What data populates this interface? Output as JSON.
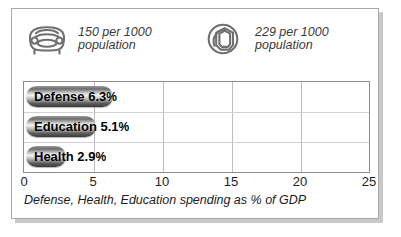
{
  "stats": [
    {
      "icon": "car-icon",
      "icon_label": "car",
      "value_text": "150 per 1000\npopulation"
    },
    {
      "icon": "telephone-icon",
      "icon_label": "telephone",
      "value_text": "229 per 1000\npopulation"
    }
  ],
  "chart_data": {
    "type": "bar",
    "orientation": "horizontal",
    "title": "",
    "caption": "Defense, Health, Education spending as % of GDP",
    "categories": [
      "Defense",
      "Education",
      "Health"
    ],
    "values": [
      6.3,
      5.1,
      2.9
    ],
    "value_labels": [
      "6.3%",
      "5.1%",
      "2.9%"
    ],
    "bar_labels": [
      "Defense 6.3%",
      "Education 5.1%",
      "Health 2.9%"
    ],
    "xlabel": "",
    "ylabel": "",
    "xlim": [
      0,
      25
    ],
    "xticks": [
      0,
      5,
      10,
      15,
      20,
      25
    ],
    "xtick_labels": [
      "0",
      "5",
      "10",
      "15",
      "20",
      "25"
    ],
    "grid": true,
    "legend": false,
    "bar_color": "#6d6d6d",
    "grid_color": "#bdbdbd",
    "border_color": "#8e8e8e"
  },
  "colors": {
    "panel_border": "#a9a9a9",
    "panel_shadow": "#c9c9c9",
    "text": "#1c1c1c",
    "muted_text": "#3a3a3a",
    "icon_stroke": "#6f6f6f"
  }
}
